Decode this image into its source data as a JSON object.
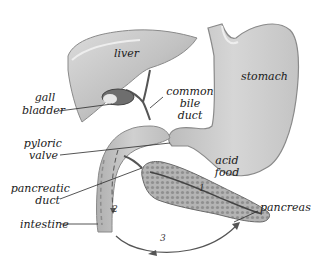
{
  "diagram": {
    "labels": {
      "liver": "liver",
      "stomach": "stomach",
      "gall_bladder_1": "gall",
      "gall_bladder_2": "bladder",
      "common_bile_duct_1": "common",
      "common_bile_duct_2": "bile",
      "common_bile_duct_3": "duct",
      "pyloric_valve_1": "pyloric",
      "pyloric_valve_2": "valve",
      "acid_food_1": "acid",
      "acid_food_2": "food",
      "pancreatic_duct_1": "pancreatic",
      "pancreatic_duct_2": "duct",
      "intestine": "intestine",
      "pancreas": "pancreas"
    },
    "step_markers": {
      "step1": "1",
      "step2": "2",
      "step3": "3"
    },
    "colors": {
      "organ_fill": "#c8c8c8",
      "organ_edge": "#8a8a8a",
      "organ_light": "#e4e4e4",
      "pancreas_fill": "#a9a9a9",
      "leader_line": "#2a2a2a",
      "background": "#ffffff"
    }
  }
}
